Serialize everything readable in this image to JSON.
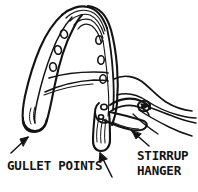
{
  "figure": {
    "ink_color": "#131313",
    "background_color": "#ffffff",
    "parts": [
      "tree-head-arch",
      "webbing-band-left",
      "webbing-band-right",
      "rivet-holes",
      "crossbar-straps",
      "gullet-point-left",
      "gullet-point-center",
      "stirrup-hanger-bar",
      "leather-flap"
    ]
  },
  "labels": {
    "gullet": "GULLET POINTS",
    "stirrup_line1": "STIRRUP",
    "stirrup_line2": "HANGER"
  },
  "annotations": {
    "arrows": [
      {
        "name": "arrow-to-gullet-point-left",
        "points_to": "gullet-point-left"
      },
      {
        "name": "arrow-to-gullet-point-center",
        "points_to": "gullet-point-center"
      },
      {
        "name": "arrow-to-stirrup-hanger",
        "points_to": "stirrup-hanger-bar"
      }
    ]
  }
}
